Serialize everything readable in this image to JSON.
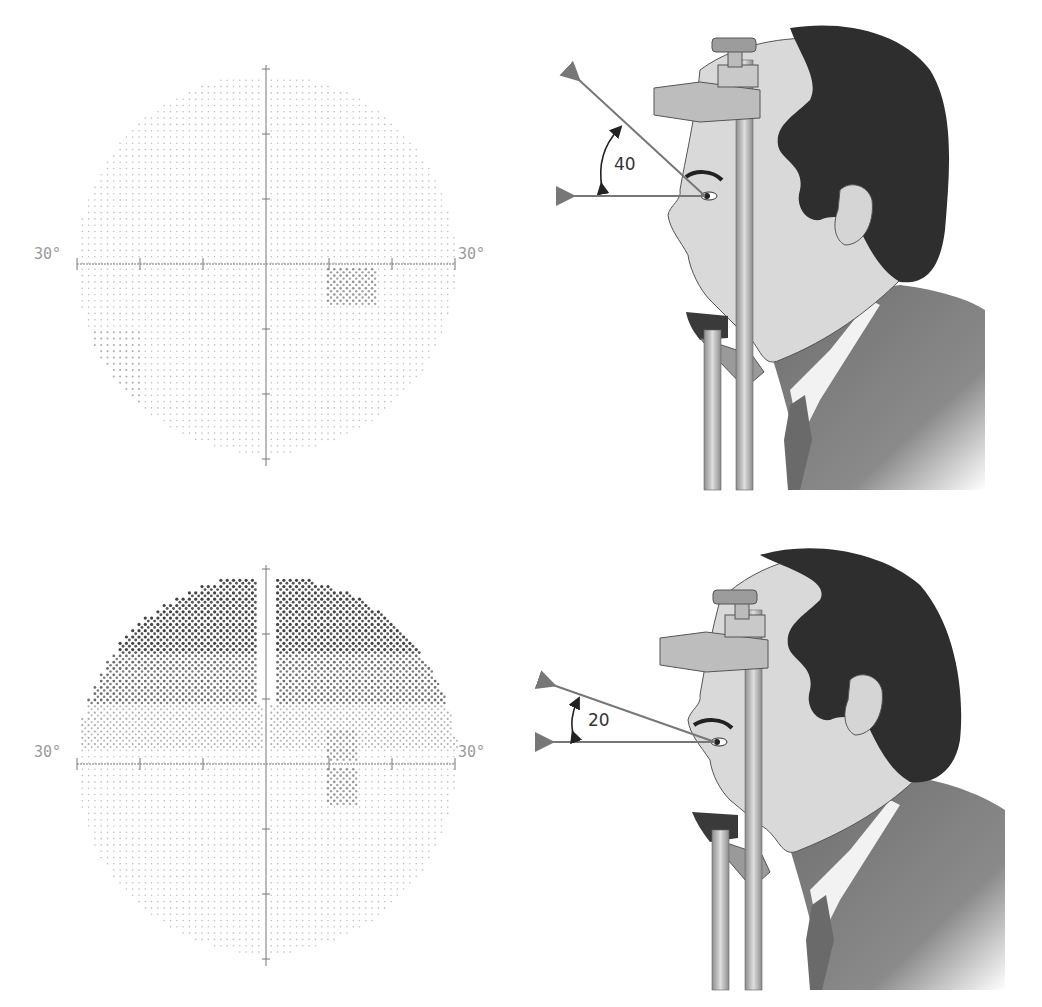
{
  "figure": {
    "panels": [
      {
        "id": "top",
        "field": {
          "left_label": "30°",
          "right_label": "30°",
          "axis_range_deg": [
            -30,
            30
          ],
          "tick_step_deg": 10,
          "defect": "small paracentral scotoma inferior-temporal to fixation; mild inferonasal depression"
        },
        "gaze": {
          "angle_label": "40",
          "angle_deg": 40
        }
      },
      {
        "id": "bottom",
        "field": {
          "left_label": "30°",
          "right_label": "30°",
          "axis_range_deg": [
            -30,
            30
          ],
          "tick_step_deg": 10,
          "defect": "dense superior altitudinal defect (artifact from head tilt / upper lid), plus paracentral scotoma"
        },
        "gaze": {
          "angle_label": "20",
          "angle_deg": 20
        }
      }
    ]
  },
  "chart_data": [
    {
      "type": "scatter",
      "title": "",
      "xlabel": "",
      "ylabel": "",
      "xlim": [
        -30,
        30
      ],
      "ylim": [
        -30,
        30
      ],
      "tick_labels": [
        "30°",
        "30°"
      ],
      "grid": false,
      "annotations": [
        "grayscale visual field, mostly normal; small dark cluster at approx (+10°..+15°, -2°..-6°)"
      ]
    },
    {
      "type": "scatter",
      "title": "",
      "xlabel": "",
      "ylabel": "",
      "xlim": [
        -30,
        30
      ],
      "ylim": [
        -30,
        30
      ],
      "tick_labels": [
        "30°",
        "30°"
      ],
      "grid": false,
      "annotations": [
        "dense superior field loss from +10° to +30° above horizontal, lighter band +5°..+15°; small clusters near (+12°, ±4°)"
      ]
    }
  ],
  "colors": {
    "axis": "#777777",
    "dot": "#888888",
    "dark_defect": "#3a3a3a",
    "mid_defect": "#8a8a8a",
    "skin": "#d9d9d9",
    "hair": "#2e2e2e",
    "suit": "#7a7a7a",
    "metal": "#b5b5b5",
    "arrow": "#7a7a7a"
  }
}
